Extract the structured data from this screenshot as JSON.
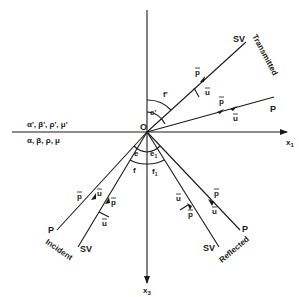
{
  "diagram": {
    "axes": {
      "horizontal_label": "x",
      "horizontal_sub": "1",
      "vertical_label": "x",
      "vertical_sub": "3",
      "origin_label": "O"
    },
    "media": {
      "upper": "α', β', ρ', μ'",
      "lower": "α, β, ρ, μ"
    },
    "rays": {
      "transmitted_label": "Transmitted",
      "incident_label": "Incident",
      "reflected_label": "Reflected",
      "p_wave": "P",
      "sv_wave": "SV"
    },
    "vectors": {
      "p": "p",
      "u": "u"
    },
    "angles": {
      "e": "e",
      "f": "f",
      "e1": "e",
      "e1_sub": "1",
      "f1": "f",
      "f1_sub": "1",
      "e_prime": "e'",
      "f_prime": "f'"
    }
  }
}
